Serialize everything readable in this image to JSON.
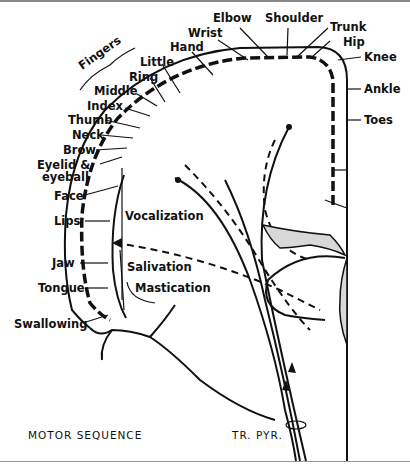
{
  "diagram": {
    "title": "MOTOR SEQUENCE",
    "tract_label": "TR. PYR.",
    "group_labels": {
      "fingers": "Fingers"
    },
    "body_parts": [
      {
        "id": "elbow",
        "label": "Elbow"
      },
      {
        "id": "shoulder",
        "label": "Shoulder"
      },
      {
        "id": "trunk",
        "label": "Trunk"
      },
      {
        "id": "hip",
        "label": "Hip"
      },
      {
        "id": "knee",
        "label": "Knee"
      },
      {
        "id": "ankle",
        "label": "Ankle"
      },
      {
        "id": "toes",
        "label": "Toes"
      },
      {
        "id": "wrist",
        "label": "Wrist"
      },
      {
        "id": "hand",
        "label": "Hand"
      },
      {
        "id": "little",
        "label": "Little"
      },
      {
        "id": "ring",
        "label": "Ring"
      },
      {
        "id": "middle",
        "label": "Middle"
      },
      {
        "id": "index",
        "label": "Index"
      },
      {
        "id": "thumb",
        "label": "Thumb"
      },
      {
        "id": "neck",
        "label": "Neck"
      },
      {
        "id": "brow",
        "label": "Brow"
      },
      {
        "id": "eyelid",
        "label": "Eyelid &"
      },
      {
        "id": "eyeball",
        "label": "eyeball"
      },
      {
        "id": "face",
        "label": "Face"
      },
      {
        "id": "lips",
        "label": "Lips"
      },
      {
        "id": "jaw",
        "label": "Jaw"
      },
      {
        "id": "tongue",
        "label": "Tongue"
      },
      {
        "id": "swallowing",
        "label": "Swallowing"
      }
    ],
    "functions": [
      {
        "id": "vocalization",
        "label": "Vocalization"
      },
      {
        "id": "salivation",
        "label": "Salivation"
      },
      {
        "id": "mastication",
        "label": "Mastication"
      }
    ]
  }
}
